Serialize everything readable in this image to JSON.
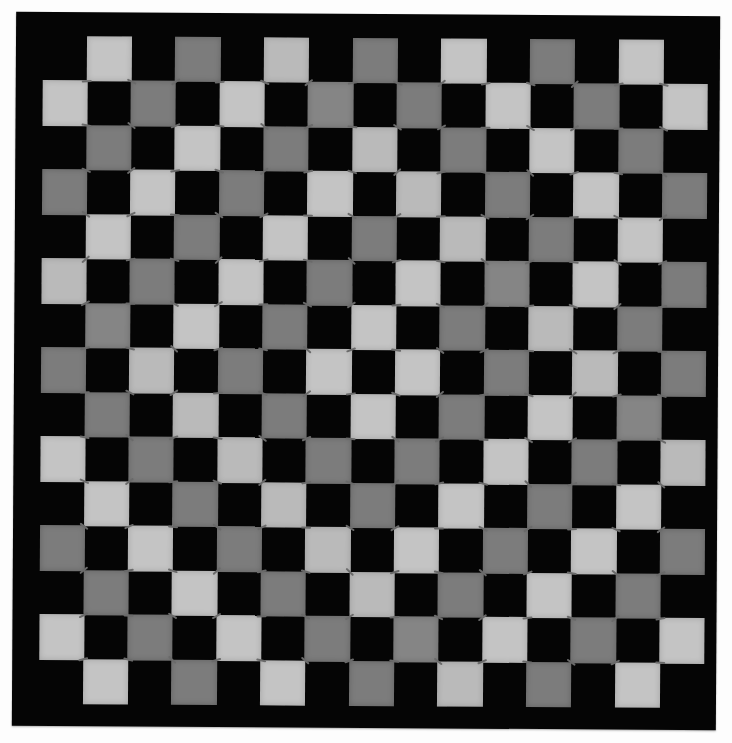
{
  "image": {
    "subject": "checkerboard quilt",
    "grid_columns": 15,
    "grid_rows": 15,
    "colors": {
      "background": "#fdfdfd",
      "border": "#050505",
      "dark_tile": "#050505",
      "light_tile": "#c4c4c4",
      "medium_tile": "#7c7c7c",
      "tie": "#6a6a6a"
    },
    "legend": {
      ".": "dark (border-colored) square",
      "L": "light gray square",
      "M": "medium gray square"
    },
    "rows": [
      ".L.M.L.M.L.M.L.",
      "L.M.L.M.M.L.M.L",
      ".M.L.M.L.M.L.M.",
      "M.L.M.L.L.M.L.M",
      ".L.M.L.M.L.M.L.",
      "L.M.L.M.L.M.L.M",
      ".M.L.M.L.M.L.M.",
      "M.L.M.L.L.M.L.M",
      ".M.L.M.L.M.L.M.",
      "L.M.L.M.M.L.M.L",
      ".L.M.L.M.L.M.L.",
      "M.L.M.L.L.M.L.M",
      ".M.L.M.L.M.L.M.",
      "L.M.L.M.M.L.M.L",
      ".L.M.L.M.L.M.L."
    ]
  }
}
